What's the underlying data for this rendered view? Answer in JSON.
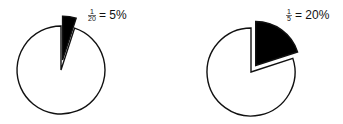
{
  "chart_data": [
    {
      "type": "pie",
      "title": "",
      "slices": [
        {
          "label": "highlighted",
          "value": 5,
          "fill": "#000000",
          "exploded": true
        },
        {
          "label": "rest",
          "value": 95,
          "fill": "#ffffff",
          "exploded": false
        }
      ],
      "annotation": {
        "numerator": "1",
        "denominator": "20",
        "text": "= 5%"
      }
    },
    {
      "type": "pie",
      "title": "",
      "slices": [
        {
          "label": "highlighted",
          "value": 20,
          "fill": "#000000",
          "exploded": true
        },
        {
          "label": "rest",
          "value": 80,
          "fill": "#ffffff",
          "exploded": false
        }
      ],
      "annotation": {
        "numerator": "1",
        "denominator": "5",
        "text": "= 20%"
      }
    }
  ],
  "colors": {
    "stroke": "#111111",
    "highlight": "#000000",
    "background": "#ffffff"
  }
}
